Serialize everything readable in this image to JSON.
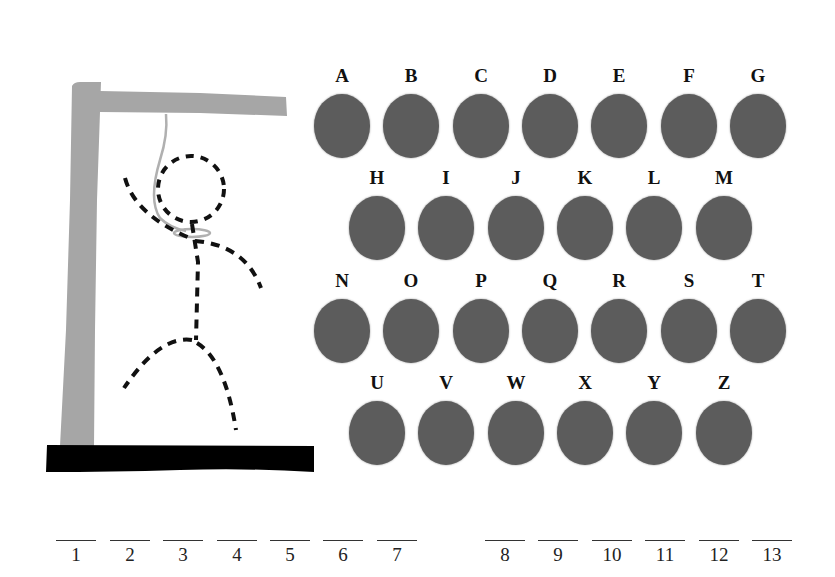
{
  "game": {
    "title": "Hangman",
    "figure_parts_drawn": [
      "head",
      "body",
      "left-arm",
      "right-arm",
      "left-leg",
      "right-leg"
    ],
    "colors": {
      "gallows": "#a6a6a6",
      "base": "#000000",
      "figure": "#111111",
      "letter_disc": "#5c5c5c",
      "rope": "#b0b0b0"
    }
  },
  "keyboard": {
    "rows": [
      [
        "A",
        "B",
        "C",
        "D",
        "E",
        "F",
        "G"
      ],
      [
        "H",
        "I",
        "J",
        "K",
        "L",
        "M"
      ],
      [
        "N",
        "O",
        "P",
        "Q",
        "R",
        "S",
        "T"
      ],
      [
        "U",
        "V",
        "W",
        "X",
        "Y",
        "Z"
      ]
    ]
  },
  "word": {
    "slots": [
      "1",
      "2",
      "3",
      "4",
      "5",
      "6",
      "7",
      "8",
      "9",
      "10",
      "11",
      "12",
      "13"
    ],
    "groups": [
      [
        "1",
        "2",
        "3",
        "4",
        "5",
        "6",
        "7"
      ],
      [
        "8",
        "9",
        "10",
        "11",
        "12",
        "13"
      ]
    ]
  }
}
